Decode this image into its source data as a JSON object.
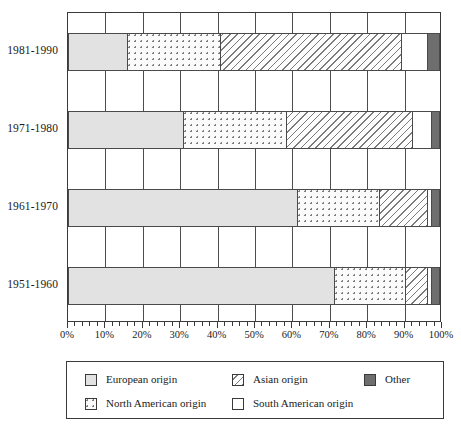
{
  "chart_data": {
    "type": "bar",
    "orientation": "horizontal",
    "stacked": true,
    "normalized": true,
    "title": "",
    "xlabel": "",
    "ylabel": "",
    "xlim": [
      0,
      100
    ],
    "grid": true,
    "legend_position": "bottom",
    "categories": [
      "1981-1990",
      "1971-1980",
      "1961-1970",
      "1951-1960"
    ],
    "tick_labels": [
      "0%",
      "10%",
      "20%",
      "30%",
      "40%",
      "50%",
      "60%",
      "70%",
      "80%",
      "90%",
      "100%"
    ],
    "tick_values": [
      0,
      10,
      20,
      30,
      40,
      50,
      60,
      70,
      80,
      90,
      100
    ],
    "minor_ticks_per_interval": 5,
    "series": [
      {
        "name": "European origin",
        "pattern": "solid-light-gray",
        "color": "#e2e2e2",
        "values": [
          16,
          31,
          62,
          72
        ]
      },
      {
        "name": "North American origin",
        "pattern": "dotted",
        "color": "#fbfbfb",
        "values": [
          25,
          28,
          22,
          19
        ]
      },
      {
        "name": "Asian origin",
        "pattern": "diagonal-hatch",
        "color": "#fdfdfd",
        "values": [
          49,
          34,
          13,
          6
        ]
      },
      {
        "name": "South American origin",
        "pattern": "white",
        "color": "#ffffff",
        "values": [
          7,
          5,
          1,
          1
        ]
      },
      {
        "name": "Other",
        "pattern": "solid-dark-gray",
        "color": "#6e6e6e",
        "values": [
          3,
          2,
          2,
          2
        ]
      }
    ],
    "cumulative_boundaries": {
      "1981-1990": [
        16,
        41,
        90,
        97,
        100
      ],
      "1971-1980": [
        31,
        59,
        93,
        98,
        100
      ],
      "1961-1970": [
        62,
        84,
        97,
        98,
        100
      ],
      "1951-1960": [
        72,
        91,
        97,
        98,
        100
      ]
    }
  },
  "legend": {
    "items": [
      {
        "label": "European origin",
        "key": "european"
      },
      {
        "label": "North American origin",
        "key": "northamerican"
      },
      {
        "label": "Asian origin",
        "key": "asian"
      },
      {
        "label": "South American origin",
        "key": "southamerican"
      },
      {
        "label": "Other",
        "key": "other"
      }
    ]
  }
}
